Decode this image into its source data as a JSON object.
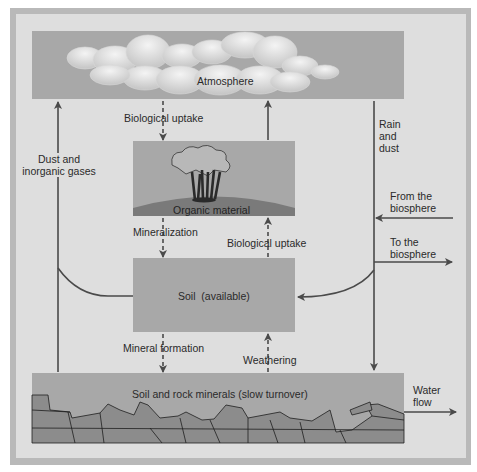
{
  "diagram": {
    "colors": {
      "frame": "#b9b9b9",
      "background": "#dedede",
      "box": "#a8a8a8",
      "arrow": "#4a4a4a",
      "rock": "#8a8a8a"
    },
    "nodes": {
      "atmosphere": "Atmosphere",
      "organic": "Organic material",
      "soil": "Soil  (available)",
      "rock": "Soil and rock minerals (slow turnover)"
    },
    "edges": {
      "atm_to_org": "Biological uptake",
      "org_to_soil": "Mineralization",
      "soil_to_org": "Biological uptake",
      "soil_to_rock": "Mineral formation",
      "rock_to_soil": "Weathering",
      "dust_gases_line1": "Dust and",
      "dust_gases_line2": "inorganic gases",
      "rain_line1": "Rain",
      "rain_line2": "and",
      "rain_line3": "dust",
      "from_bio_line1": "From the",
      "from_bio_line2": "biosphere",
      "to_bio_line1": "To the",
      "to_bio_line2": "biosphere",
      "water_line1": "Water",
      "water_line2": "flow"
    }
  }
}
